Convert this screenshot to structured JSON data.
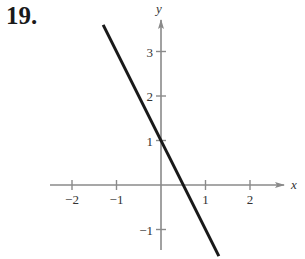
{
  "problem": {
    "number": "19."
  },
  "chart_data": {
    "type": "line",
    "title": "",
    "xlabel": "x",
    "ylabel": "y",
    "xlim": [
      -2.5,
      2.8
    ],
    "ylim": [
      -1.6,
      3.9
    ],
    "grid": false,
    "x_ticks": [
      -2,
      -1,
      1,
      2
    ],
    "y_ticks": [
      -1,
      1,
      2,
      3
    ],
    "x_tick_labels": [
      "−2",
      "−1",
      "1",
      "2"
    ],
    "y_tick_labels": [
      "−1",
      "1",
      "2",
      "3"
    ],
    "series": [
      {
        "name": "line",
        "equation": "y = -2x + 1",
        "x": [
          -1.3,
          1.3
        ],
        "y": [
          3.6,
          -1.6
        ],
        "color": "#1a1a1a"
      }
    ]
  },
  "colors": {
    "axis": "#8a8a8a",
    "line": "#1a1a1a",
    "text": "#333333"
  }
}
